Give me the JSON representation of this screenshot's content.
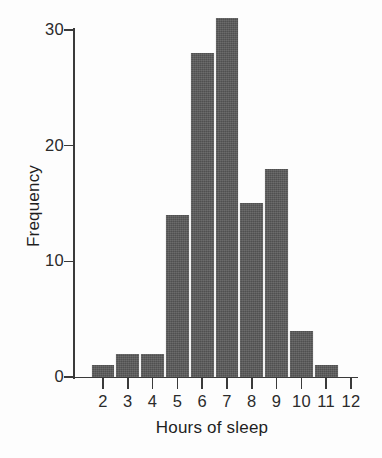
{
  "chart_data": {
    "type": "bar",
    "title": "",
    "subtitle": "",
    "xlabel": "Hours of sleep",
    "ylabel": "Frequency",
    "categories": [
      "2",
      "3",
      "4",
      "5",
      "6",
      "7",
      "8",
      "9",
      "10",
      "11"
    ],
    "values": [
      1,
      2,
      2,
      14,
      28,
      31,
      15,
      18,
      4,
      1
    ],
    "xtick_labels": [
      "2",
      "3",
      "4",
      "5",
      "6",
      "7",
      "8",
      "9",
      "10",
      "11",
      "12"
    ],
    "ytick_labels": [
      "0",
      "10",
      "20",
      "30"
    ],
    "ytick_values": [
      0,
      10,
      20,
      30
    ],
    "xlim": [
      1.5,
      12.5
    ],
    "ylim": [
      0,
      31
    ],
    "grid": false,
    "legend": null,
    "bar_color": "#575757",
    "axis_color": "#3a3a3a",
    "background_color": "#fdfdfd",
    "annotations": []
  },
  "figure": {
    "y_axis_title": "Frequency",
    "x_axis_title": "Hours of sleep"
  }
}
